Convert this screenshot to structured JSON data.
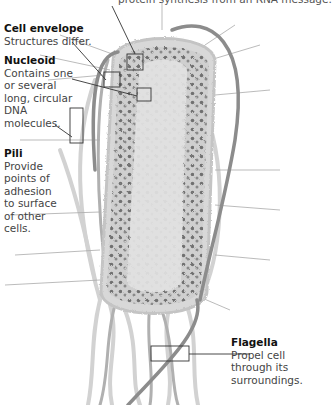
{
  "figure": {
    "type": "labeled cell diagram",
    "palette": {
      "background": "#ffffff",
      "cell_body": "#d4d4d4",
      "granules": "#6e6e6e",
      "flagella_dark": "#8a8a8a",
      "flagella_light": "#cfcfcf",
      "callout_line": "#333333"
    }
  },
  "labels": {
    "top_caption": "protein synthesis from an RNA message.",
    "cell_envelope": {
      "title": "Cell envelope",
      "text": "Structures differ."
    },
    "nucleoid": {
      "title": "Nucleoid",
      "text": "Contains one or several long, circular DNA molecules."
    },
    "pili": {
      "title": "Pili",
      "text": "Provide points of adhesion to surface of other cells."
    },
    "flagella": {
      "title": "Flagella",
      "text": "Propel cell through its surroundings."
    }
  },
  "callout_boxes": [
    {
      "target": "ribosome (top caption)",
      "x": 127,
      "y": 54,
      "w": 16,
      "h": 16
    },
    {
      "target": "cell_envelope",
      "x": 104,
      "y": 72,
      "w": 16,
      "h": 15
    },
    {
      "target": "nucleoid",
      "x": 137,
      "y": 88,
      "w": 14,
      "h": 13
    },
    {
      "target": "pili",
      "x": 70,
      "y": 108,
      "w": 13,
      "h": 35
    },
    {
      "target": "flagella",
      "x": 151,
      "y": 346,
      "w": 38,
      "h": 15
    }
  ]
}
